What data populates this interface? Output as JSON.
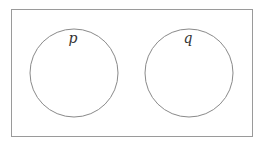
{
  "diagram": {
    "type": "venn",
    "universe": {
      "label": ""
    },
    "sets": [
      {
        "label": "p"
      },
      {
        "label": "q"
      }
    ],
    "stroke_color": "#8a8a8a"
  }
}
